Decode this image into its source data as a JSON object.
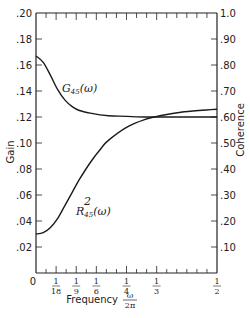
{
  "chart_data": {
    "type": "line",
    "title": "",
    "xlabel": "Frequency ω/2π",
    "ylabel": "Gain",
    "y2label": "Coherence",
    "xlim": [
      0,
      0.5
    ],
    "ylim": [
      0,
      0.2
    ],
    "y2lim": [
      0,
      1.0
    ],
    "grid": false,
    "legend": "inline curve labels",
    "x_ticks": [
      {
        "value": 0,
        "label": "0"
      },
      {
        "value": 0.0556,
        "label": "1/18"
      },
      {
        "value": 0.1111,
        "label": "1/9"
      },
      {
        "value": 0.1667,
        "label": "1/6"
      },
      {
        "value": 0.25,
        "label": "1/4"
      },
      {
        "value": 0.3333,
        "label": "1/3"
      },
      {
        "value": 0.5,
        "label": "1/2"
      }
    ],
    "y_ticks": [
      ".02",
      ".04",
      ".06",
      ".08",
      ".10",
      ".12",
      ".14",
      ".16",
      ".18",
      ".20"
    ],
    "y2_ticks": [
      ".10",
      ".20",
      ".30",
      ".40",
      ".50",
      ".60",
      ".70",
      ".80",
      ".90",
      "1.0"
    ],
    "series": [
      {
        "name": "G45(ω)",
        "axis": "left",
        "label_main": "G",
        "label_sub": "45",
        "label_arg": "(ω)",
        "x": [
          0,
          0.02,
          0.04,
          0.06,
          0.08,
          0.1,
          0.12,
          0.15,
          0.2,
          0.25,
          0.3,
          0.35,
          0.4,
          0.45,
          0.5
        ],
        "values": [
          0.167,
          0.162,
          0.152,
          0.141,
          0.133,
          0.128,
          0.125,
          0.123,
          0.121,
          0.1205,
          0.12,
          0.12,
          0.12,
          0.12,
          0.12
        ]
      },
      {
        "name": "R²45(ω)",
        "axis": "right",
        "label_main": "R",
        "label_sup": "2",
        "label_sub": "45",
        "label_arg": "(ω)",
        "x": [
          0,
          0.02,
          0.04,
          0.06,
          0.08,
          0.1,
          0.12,
          0.15,
          0.18,
          0.2,
          0.25,
          0.3,
          0.35,
          0.4,
          0.45,
          0.5
        ],
        "values": [
          0.15,
          0.155,
          0.175,
          0.21,
          0.26,
          0.31,
          0.36,
          0.425,
          0.48,
          0.51,
          0.56,
          0.59,
          0.607,
          0.618,
          0.625,
          0.63
        ]
      }
    ]
  },
  "labels": {
    "y_axis_title": "Gain",
    "y2_axis_title": "Coherence",
    "x_axis_title": "Frequency",
    "x_axis_frac_num": "ω",
    "x_axis_frac_den": "2π"
  }
}
